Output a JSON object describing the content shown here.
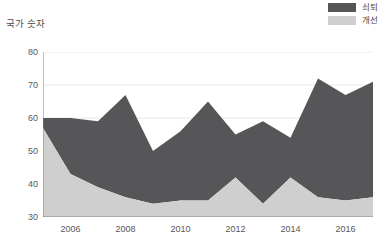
{
  "y_axis_title": "국가 숫자",
  "legend": {
    "position": "top-right",
    "entries": [
      {
        "label": "쇠퇴",
        "color": "#565659",
        "name": "decline"
      },
      {
        "label": "개선",
        "color": "#cfcfcf",
        "name": "improvement"
      }
    ]
  },
  "axis": {
    "y_ticks": [
      30,
      40,
      50,
      60,
      70,
      80
    ],
    "y_minor_ticks": [
      35,
      45,
      55,
      65,
      75
    ],
    "x_ticks": [
      2006,
      2008,
      2010,
      2012,
      2014,
      2016
    ]
  },
  "chart_data": {
    "type": "area",
    "stacked": true,
    "title": "",
    "subtitle": "",
    "xlabel": "",
    "ylabel": "국가 숫자",
    "xlim": [
      2005,
      2017
    ],
    "ylim": [
      30,
      80
    ],
    "grid": true,
    "legend_position": "top-right",
    "x": [
      2005,
      2006,
      2007,
      2008,
      2009,
      2010,
      2011,
      2012,
      2013,
      2014,
      2015,
      2016,
      2017
    ],
    "categories": [
      "2005",
      "2006",
      "2007",
      "2008",
      "2009",
      "2010",
      "2011",
      "2012",
      "2013",
      "2014",
      "2015",
      "2016",
      "2017"
    ],
    "series": [
      {
        "name": "개선",
        "color": "#cfcfcf",
        "values": [
          57,
          43,
          39,
          36,
          34,
          35,
          35,
          42,
          34,
          42,
          36,
          35,
          36
        ]
      },
      {
        "name": "쇠퇴",
        "color": "#565659",
        "values": [
          3,
          17,
          20,
          31,
          16,
          21,
          30,
          13,
          25,
          12,
          36,
          32,
          35
        ]
      }
    ],
    "series_totals": {
      "name": "total (stacked top)",
      "values": [
        60,
        60,
        59,
        67,
        50,
        56,
        65,
        55,
        59,
        54,
        72,
        67,
        71
      ]
    },
    "x_tick_labels": [
      "2006",
      "2008",
      "2010",
      "2012",
      "2014",
      "2016"
    ],
    "y_tick_labels": [
      "30",
      "40",
      "50",
      "60",
      "70",
      "80"
    ]
  }
}
